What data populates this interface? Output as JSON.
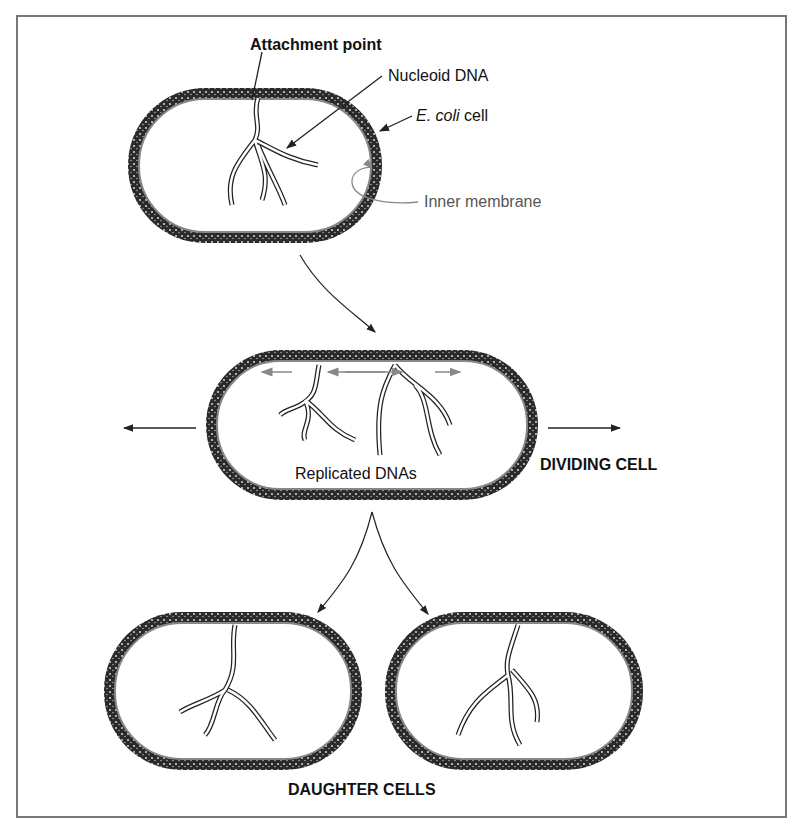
{
  "labels": {
    "attachment_point": "Attachment point",
    "nucleoid_dna": "Nucleoid DNA",
    "ecoli_italic": "E. coli",
    "ecoli_rest": " cell",
    "inner_membrane": "Inner membrane",
    "replicated_dnas": "Replicated DNAs",
    "dividing_cell": "DIVIDING CELL",
    "daughter_cells": "DAUGHTER CELLS"
  },
  "colors": {
    "wall": "#2a2a2a",
    "membrane": "#888888",
    "line": "#222222"
  }
}
